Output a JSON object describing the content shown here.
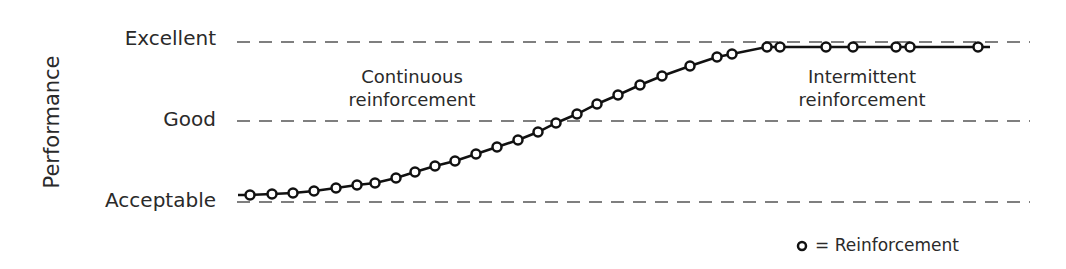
{
  "chart_data": {
    "type": "line",
    "title": "",
    "xlabel": "",
    "ylabel": "Performance",
    "y_levels": [
      {
        "label": "Excellent",
        "y_px": 42
      },
      {
        "label": "Good",
        "y_px": 120
      },
      {
        "label": "Acceptable",
        "y_px": 201
      }
    ],
    "grid": "dashed horizontal lines at each level",
    "annotations": [
      {
        "text_lines": [
          "Continuous",
          "reinforcement"
        ],
        "x": 412,
        "y": 83
      },
      {
        "text_lines": [
          "Intermittent",
          "reinforcement"
        ],
        "x": 862,
        "y": 83
      }
    ],
    "legend": {
      "marker": "o",
      "text": "= Reinforcement",
      "position": "bottom-right"
    },
    "series": [
      {
        "name": "Performance",
        "points_px": [
          [
            250,
            195
          ],
          [
            272,
            194
          ],
          [
            293,
            193
          ],
          [
            314,
            191
          ],
          [
            336,
            188
          ],
          [
            357,
            185
          ],
          [
            375,
            183
          ],
          [
            396,
            178
          ],
          [
            415,
            172
          ],
          [
            435,
            166
          ],
          [
            455,
            161
          ],
          [
            476,
            154
          ],
          [
            497,
            147
          ],
          [
            518,
            140
          ],
          [
            538,
            132
          ],
          [
            556,
            123
          ],
          [
            577,
            114
          ],
          [
            597,
            104
          ],
          [
            618,
            95
          ],
          [
            640,
            85
          ],
          [
            662,
            76
          ],
          [
            690,
            66
          ],
          [
            717,
            57
          ],
          [
            732,
            54
          ],
          [
            767,
            47
          ],
          [
            780,
            47
          ],
          [
            826,
            47
          ],
          [
            853,
            47
          ],
          [
            896,
            47
          ],
          [
            910,
            47
          ],
          [
            978,
            47
          ]
        ],
        "line_end_px": [
          990,
          47
        ]
      }
    ]
  },
  "labels": {
    "y_axis": "Performance",
    "level_excellent": "Excellent",
    "level_good": "Good",
    "level_acceptable": "Acceptable",
    "continuous_1": "Continuous",
    "continuous_2": "reinforcement",
    "intermittent_1": "Intermittent",
    "intermittent_2": "reinforcement",
    "legend_marker": "o",
    "legend_text": "= Reinforcement"
  }
}
